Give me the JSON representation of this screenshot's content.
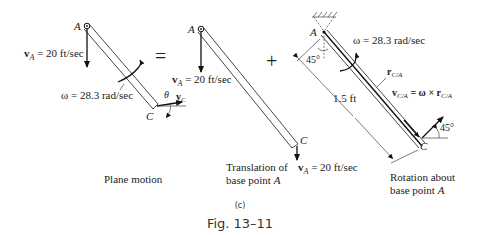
{
  "figure": {
    "subfigure_label": "(c)",
    "caption": "Fig. 13–11"
  },
  "operators": {
    "equals": "=",
    "plus": "+"
  },
  "panels": [
    {
      "title": "Plane motion",
      "point_A": "A",
      "point_C": "C",
      "vA_symbol": "v",
      "vA_sub": "A",
      "vA_value": " = 20 ft/sec",
      "omega_label": "ω = 28.3 rad/sec",
      "theta": "θ",
      "vC_symbol": "v",
      "vC_sub": "C"
    },
    {
      "title_line1": "Translation of",
      "title_line2": "base point ",
      "title_point": "A",
      "point_A": "A",
      "point_C": "C",
      "vA_symbol": "v",
      "vA_sub": "A",
      "vA_value": " = 20 ft/sec",
      "vA_bottom_symbol": "v",
      "vA_bottom_sub": "A",
      "vA_bottom_value": " = 20 ft/sec"
    },
    {
      "title_line1": "Rotation about",
      "title_line2": "base point ",
      "title_point": "A",
      "point_A": "A",
      "point_C": "C",
      "angle_top": "45°",
      "angle_bottom": "45°",
      "length": "1.5 ft",
      "omega_label": "ω = 28.3 rad/sec",
      "rCA_symbol": "r",
      "rCA_sub": "C/A",
      "vCA_symbol": "v",
      "vCA_sub": "C/A",
      "vCA_eq": " = ω × r",
      "vCA_eq_sub": "C/A"
    }
  ]
}
